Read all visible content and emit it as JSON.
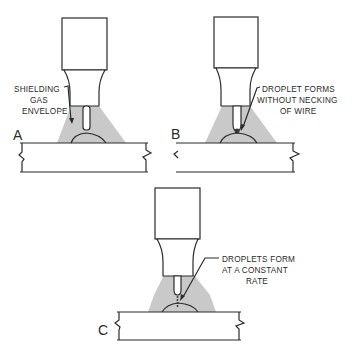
{
  "figure": {
    "panels": [
      {
        "id": "A",
        "label": "A",
        "annotation_lines": [
          "SHIELDING",
          "GAS",
          "ENVELOPE"
        ]
      },
      {
        "id": "B",
        "label": "B",
        "annotation_lines": [
          "DROPLET FORMS",
          "WITHOUT NECKING",
          "OF WIRE"
        ]
      },
      {
        "id": "C",
        "label": "C",
        "annotation_lines": [
          "DROPLETS FORM",
          "AT A CONSTANT",
          "RATE"
        ]
      }
    ]
  },
  "colors": {
    "line": "#2b2b2b",
    "gas_envelope": "#c9c9c9",
    "background": "#ffffff"
  }
}
